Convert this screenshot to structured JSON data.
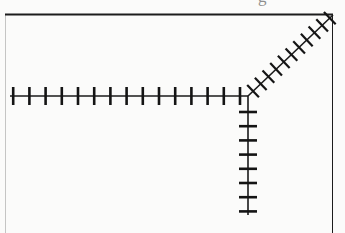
{
  "figure": {
    "background_color": "#fbfbfa",
    "ink_color": "#1a1a1a",
    "width": 345,
    "height": 233
  },
  "frame": {
    "name": "plot-border",
    "stroke_color": "#1c1c1c",
    "top_y": 14,
    "left_x": 5,
    "right_x": 332,
    "bottom_y": 233,
    "top_stroke_width": 2.2,
    "right_stroke_width": 1.0,
    "left_stroke_width": 0.7,
    "note": "Heavy top rule and faint right rule; frame is open at the bottom."
  },
  "cropped_text": {
    "name": "clipped-caption-descender",
    "glyph": "g",
    "x": 258,
    "y": -12,
    "color": "#8e8e8e",
    "note": "Bottom of a letter from text cropped off above the figure."
  },
  "origin": {
    "x": 248,
    "y": 96,
    "label": "axis junction"
  },
  "chart_data": {
    "type": "line",
    "subtitle": "",
    "xlabel": "",
    "ylabel": "",
    "grid": false,
    "legend": "none",
    "axes": [
      {
        "name": "horizontal-axis",
        "orientation": "horizontal-left",
        "direction_degrees": 180,
        "start": [
          248,
          96
        ],
        "end": [
          10,
          96
        ],
        "length_px": 238,
        "stroke_width": 1.6,
        "tick_count": 15,
        "tick_spacing_px": 16.2,
        "tick_first_offset_px": 8,
        "tick_length_px": 18,
        "tick_orientation": "perpendicular-vertical",
        "tick_stroke_width": 2.6
      },
      {
        "name": "vertical-axis",
        "orientation": "vertical-down",
        "direction_degrees": 270,
        "start": [
          248,
          96
        ],
        "end": [
          248,
          215
        ],
        "length_px": 119,
        "stroke_width": 1.6,
        "tick_count": 9,
        "tick_spacing_px": 14.2,
        "tick_first_offset_px": 16,
        "tick_length_px": 18,
        "tick_orientation": "perpendicular-horizontal",
        "tick_stroke_width": 2.6
      },
      {
        "name": "diagonal-axis",
        "orientation": "diagonal-upper-right",
        "direction_degrees": 45,
        "start": [
          248,
          96
        ],
        "end": [
          333,
          15
        ],
        "length_px": 117,
        "stroke_width": 1.6,
        "tick_count": 11,
        "tick_spacing_px": 10.6,
        "tick_first_offset_px": 7,
        "tick_length_px": 17,
        "tick_orientation": "perpendicular-diagonal",
        "tick_stroke_width": 2.2
      }
    ]
  }
}
